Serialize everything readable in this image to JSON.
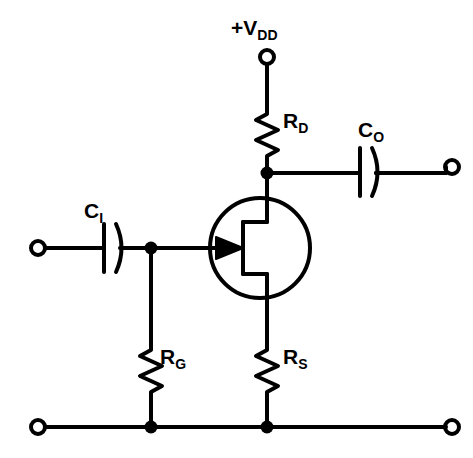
{
  "diagram": {
    "type": "schematic",
    "background_color": "#ffffff",
    "line_color": "#000000"
  },
  "labels": {
    "supply": {
      "main": "+V",
      "sub": "DD"
    },
    "drain_resistor": {
      "main": "R",
      "sub": "D"
    },
    "output_capacitor": {
      "main": "C",
      "sub": "O"
    },
    "input_capacitor": {
      "main": "C",
      "sub": "I"
    },
    "gate_resistor": {
      "main": "R",
      "sub": "G"
    },
    "source_resistor": {
      "main": "R",
      "sub": "S"
    }
  },
  "components": {
    "terminals": [
      {
        "name": "supply-terminal",
        "x": 267,
        "y": 57,
        "r": 7
      },
      {
        "name": "input-terminal",
        "x": 38,
        "y": 248,
        "r": 7
      },
      {
        "name": "output-terminal",
        "x": 452,
        "y": 167,
        "r": 7
      },
      {
        "name": "ground-left-terminal",
        "x": 38,
        "y": 427,
        "r": 7
      },
      {
        "name": "ground-right-terminal",
        "x": 452,
        "y": 427,
        "r": 7
      }
    ],
    "junctions": [
      {
        "name": "drain-node",
        "x": 267,
        "y": 173,
        "r": 6
      },
      {
        "name": "gate-node",
        "x": 151,
        "y": 248,
        "r": 6
      },
      {
        "name": "ground-gate-node",
        "x": 151,
        "y": 427,
        "r": 6
      },
      {
        "name": "ground-source-node",
        "x": 267,
        "y": 427,
        "r": 6
      }
    ],
    "transistor": {
      "name": "n-channel-jfet",
      "circle": {
        "cx": 260,
        "cy": 248,
        "r": 50
      },
      "channel_x": 243,
      "lead_x": 267
    }
  }
}
